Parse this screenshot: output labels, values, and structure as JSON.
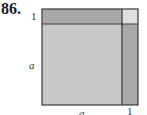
{
  "problem": {
    "number": "86."
  },
  "diagram": {
    "labels": {
      "left_top": "1",
      "left_middle": "a",
      "bottom_middle": "a",
      "bottom_right": "1"
    },
    "regions": [
      {
        "name": "big-square",
        "size": "a×a",
        "color": "#c8c8c8"
      },
      {
        "name": "top-strip",
        "size": "a×1",
        "color": "#a9a9a9"
      },
      {
        "name": "right-strip",
        "size": "1×a",
        "color": "#a9a9a9"
      },
      {
        "name": "corner-square",
        "size": "1×1",
        "color": "#dedede"
      }
    ],
    "colors": {
      "outline": "#3a3a3a"
    }
  }
}
